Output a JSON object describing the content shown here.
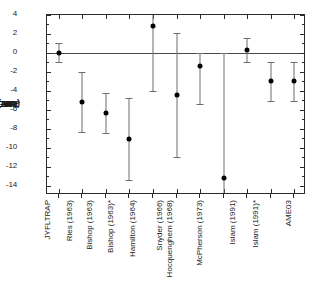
{
  "chart_data": {
    "type": "scatter",
    "title": "",
    "xlabel": "",
    "ylabel": "ME_JYFL - ME_LIT (keV)",
    "ylabel_parts": {
      "lead": "ME",
      "sub1": "JYFL",
      "mid": " - ME",
      "sub2": "LIT",
      "tail": " (keV)"
    },
    "ylim": [
      -15,
      4
    ],
    "yticks": [
      4,
      2,
      0,
      -2,
      -4,
      -6,
      -8,
      -10,
      -12,
      -14
    ],
    "ytick_labels": [
      "4",
      "2",
      "0",
      "-2",
      "-4",
      "-6",
      "-8",
      "-10",
      "-12",
      "-14"
    ],
    "yminor_step": 1,
    "grid": false,
    "legend": "none",
    "zero_reference_line": 0,
    "categories": [
      "JYFLTRAP",
      "Ries (1963)",
      "Bishop (1963)",
      "Bishop (1963)*",
      "Hamilton (1964)",
      "Snyder (1966)",
      "Hocquenghem (1968)",
      "McPherson (1973)",
      "Islam (1991)",
      "Islam (1991)*",
      "AME03"
    ],
    "values": [
      0.0,
      -5.2,
      -6.3,
      -9.1,
      2.8,
      -4.4,
      -1.4,
      -13.2,
      0.3,
      -3.0,
      -3.0
    ],
    "err_upper": [
      1.0,
      3.2,
      2.1,
      4.3,
      1.3,
      6.5,
      1.4,
      13.2,
      1.3,
      2.0,
      2.0
    ],
    "err_lower": [
      1.0,
      3.1,
      2.2,
      4.3,
      6.8,
      6.6,
      4.0,
      1.8,
      1.3,
      2.1,
      2.1
    ]
  },
  "axis": {
    "frame_color": "#2b2b2b",
    "marker_color": "#000000",
    "errorbar_color": "#6e6e6e",
    "zero_line_color": "#4a4a4a"
  }
}
